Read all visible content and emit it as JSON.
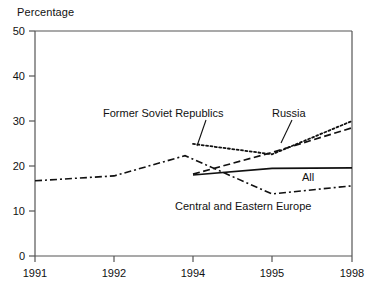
{
  "chart_data": {
    "type": "line",
    "title": "",
    "xlabel": "",
    "ylabel": "Percentage",
    "ylim": [
      0,
      50
    ],
    "yticks": [
      0,
      10,
      20,
      30,
      40,
      50
    ],
    "grid": false,
    "legend_position": "inline-annotations",
    "categories": [
      "1991",
      "1992",
      "1994",
      "1995",
      "1998"
    ],
    "x": [
      1991,
      1992,
      1994,
      1995,
      1998
    ],
    "series": [
      {
        "name": "Former Soviet Republics",
        "style": "dotted",
        "x": [
          1994,
          1995,
          1998
        ],
        "values": [
          24.9,
          22.6,
          30.0
        ]
      },
      {
        "name": "Russia",
        "style": "dashed",
        "x": [
          1994,
          1995,
          1998
        ],
        "values": [
          18.2,
          23.0,
          28.5
        ]
      },
      {
        "name": "All",
        "style": "solid",
        "x": [
          1994,
          1995,
          1998
        ],
        "values": [
          18.0,
          19.5,
          19.6
        ]
      },
      {
        "name": "Central and Eastern Europe",
        "style": "dash-dot",
        "x": [
          1991,
          1992,
          1994,
          1995,
          1998
        ],
        "values": [
          16.7,
          17.8,
          22.3,
          13.8,
          15.6
        ]
      }
    ],
    "annotations": [
      {
        "text": "Former Soviet Republics",
        "target_series": "Former Soviet Republics"
      },
      {
        "text": "Russia",
        "target_series": "Russia"
      },
      {
        "text": "All",
        "target_series": "All"
      },
      {
        "text": "Central and Eastern Europe",
        "target_series": "Central and Eastern Europe"
      }
    ]
  },
  "yaxis": {
    "title": "Percentage",
    "ticks": [
      "50",
      "40",
      "30",
      "20",
      "10",
      "0"
    ]
  },
  "xaxis": {
    "ticks": [
      "1991",
      "1992",
      "1994",
      "1995",
      "1998"
    ]
  },
  "labels": {
    "former_soviet_republics": "Former Soviet Republics",
    "russia": "Russia",
    "all": "All",
    "central_and_eastern_europe": "Central and Eastern Europe"
  },
  "colors": {
    "line": "#111111",
    "axis": "#555555",
    "background": "#ffffff"
  }
}
